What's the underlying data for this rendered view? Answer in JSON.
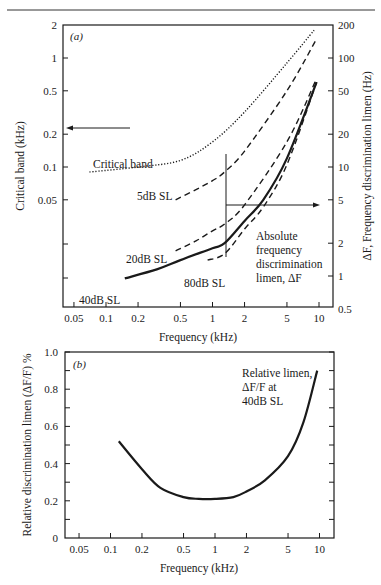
{
  "chart_data": [
    {
      "panel": "a",
      "type": "line",
      "panel_label": "(a)",
      "xlabel": "Frequency (kHz)",
      "ylabel_left": "Critical band (kHz)",
      "ylabel_right": "ΔF, Frequency discrimination limen (Hz)",
      "xscale": "log",
      "yscale": "log",
      "xlim": [
        0.04,
        13
      ],
      "ylim_left": [
        0.025,
        2
      ],
      "ylim_right": [
        0.5,
        200
      ],
      "x_ticks": [
        0.05,
        0.1,
        0.2,
        0.5,
        1,
        2,
        5,
        10
      ],
      "x_tick_labels": [
        "0.05",
        "0.1",
        "0.2",
        "0.5",
        "1",
        "2",
        "5",
        "10"
      ],
      "y_left_ticks": [
        2,
        1,
        0.5,
        0.2,
        0.1,
        0.05
      ],
      "y_left_tick_labels": [
        "2",
        "1",
        "0.5",
        "0.2",
        "0.1",
        "0.05"
      ],
      "y_right_ticks": [
        200,
        100,
        50,
        20,
        10,
        5,
        2,
        1,
        0.5
      ],
      "y_right_tick_labels": [
        "200",
        "100",
        "50",
        "20",
        "10",
        "5",
        "2",
        "1",
        "0.5"
      ],
      "grid": false,
      "series": [
        {
          "name": "Critical band",
          "axis": "left",
          "style": "dotted",
          "x": [
            0.07,
            0.2,
            0.5,
            1,
            2,
            5,
            9
          ],
          "y": [
            0.09,
            0.1,
            0.115,
            0.17,
            0.32,
            0.9,
            1.8
          ]
        },
        {
          "name": "5dB SL",
          "axis": "right",
          "style": "dashed",
          "x": [
            0.45,
            0.7,
            1,
            1.3,
            2,
            5,
            9.5
          ],
          "y": [
            5,
            6.2,
            7.5,
            9,
            14,
            50,
            150
          ]
        },
        {
          "name": "20dB SL",
          "axis": "right",
          "style": "dashed",
          "x": [
            0.45,
            0.7,
            1,
            1.3,
            2,
            5,
            9.5
          ],
          "y": [
            1.7,
            2.1,
            2.6,
            3,
            4.5,
            17,
            65
          ]
        },
        {
          "name": "40dB SL",
          "axis": "right",
          "style": "solid",
          "x": [
            0.15,
            0.3,
            0.5,
            1,
            1.3,
            2,
            3,
            5,
            9.5
          ],
          "y": [
            0.95,
            1.15,
            1.4,
            1.8,
            2.0,
            3.2,
            5,
            12,
            60
          ]
        },
        {
          "name": "80dB SL",
          "axis": "right",
          "style": "dashed",
          "x": [
            0.9,
            1.3,
            2,
            3,
            5,
            9.5
          ],
          "y": [
            1.4,
            1.6,
            2.7,
            4.3,
            10.5,
            60
          ]
        }
      ],
      "annotations": [
        {
          "text": "Critical band",
          "arrow": "left",
          "points_to": "left axis"
        },
        {
          "text": "5dB SL"
        },
        {
          "text": "20dB SL"
        },
        {
          "text": "40dB SL"
        },
        {
          "text": "80dB SL"
        },
        {
          "text": "Absolute frequency discrimination limen, ΔF",
          "arrow": "right",
          "points_to": "right axis"
        }
      ]
    },
    {
      "panel": "b",
      "type": "line",
      "panel_label": "(b)",
      "xlabel": "Frequency (kHz)",
      "ylabel": "Relative discrimination limen (ΔF/F) %",
      "xscale": "log",
      "yscale": "linear",
      "xlim": [
        0.04,
        13
      ],
      "ylim": [
        0,
        1.0
      ],
      "x_ticks": [
        0.05,
        0.1,
        0.2,
        0.5,
        1,
        2,
        5,
        10
      ],
      "x_tick_labels": [
        "0.05",
        "0.1",
        "0.2",
        "0.5",
        "1",
        "2",
        "5",
        "10"
      ],
      "y_ticks": [
        0,
        0.2,
        0.4,
        0.6,
        0.8,
        1.0
      ],
      "y_tick_labels": [
        "0",
        "0.2",
        "0.4",
        "0.6",
        "0.8",
        "1.0"
      ],
      "grid": false,
      "series": [
        {
          "name": "Relative limen, ΔF/F at 40dB SL",
          "style": "solid",
          "x": [
            0.12,
            0.2,
            0.3,
            0.5,
            0.7,
            1,
            1.5,
            2,
            3,
            5,
            7,
            9.5
          ],
          "y": [
            0.52,
            0.37,
            0.27,
            0.22,
            0.21,
            0.21,
            0.22,
            0.25,
            0.31,
            0.44,
            0.62,
            0.9
          ]
        }
      ],
      "annotations": [
        {
          "text": "Relative limen, ΔF/F at 40dB SL"
        }
      ]
    }
  ],
  "labels": {
    "a": {
      "panel": "(a)",
      "ylabel_left": "Critical band (kHz)",
      "ylabel_right": "ΔF, Frequency discrimination limen (Hz)",
      "xlabel": "Frequency (kHz)",
      "critical_band": "Critical band",
      "sl5": "5dB SL",
      "sl20": "20dB SL",
      "sl40": "40dB SL",
      "sl80": "80dB SL",
      "absolute": [
        "Absolute",
        "frequency",
        "discrimination",
        "limen, ΔF"
      ]
    },
    "b": {
      "panel": "(b)",
      "ylabel": "Relative discrimination limen (ΔF/F) %",
      "xlabel": "Frequency (kHz)",
      "relative": [
        "Relative limen,",
        "ΔF/F at",
        "40dB SL"
      ]
    }
  }
}
